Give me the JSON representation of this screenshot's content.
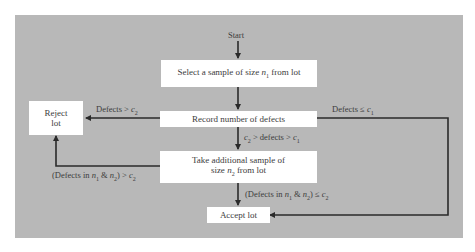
{
  "diagram": {
    "type": "flowchart",
    "colors": {
      "panel": "#b8b8b8",
      "box": "#ffffff",
      "line": "#2a2a2a",
      "text": "#3c3c3c"
    },
    "start_label": "Start",
    "nodes": {
      "select_sample": {
        "text_pre": "Select a sample of size ",
        "var": "n",
        "sub": "1",
        "text_post": " from lot"
      },
      "record_defects": {
        "text": "Record number of defects"
      },
      "reject_lot": {
        "line1": "Reject",
        "line2": "lot"
      },
      "take_additional": {
        "line1": "Take additional sample of",
        "line2_pre": "size ",
        "var": "n",
        "sub": "2",
        "line2_post": " from lot"
      },
      "accept_lot": {
        "text": "Accept lot"
      }
    },
    "edges": {
      "reject_first": {
        "pre": "Defects > ",
        "var": "c",
        "sub": "2"
      },
      "accept_first": {
        "pre": "Defects ≤ ",
        "var": "c",
        "sub": "1"
      },
      "second_sample": {
        "v1": "c",
        "s1": "2",
        "mid": " > defects > ",
        "v2": "c",
        "s2": "1"
      },
      "reject_second": {
        "pre": "(Defects in ",
        "v1": "n",
        "s1": "1",
        "amp": " & ",
        "v2": "n",
        "s2": "2",
        "post": ") > ",
        "v3": "c",
        "s3": "2"
      },
      "accept_second": {
        "pre": "(Defects in ",
        "v1": "n",
        "s1": "1",
        "amp": " & ",
        "v2": "n",
        "s2": "2",
        "post": ") ≤ ",
        "v3": "c",
        "s3": "2"
      }
    }
  }
}
